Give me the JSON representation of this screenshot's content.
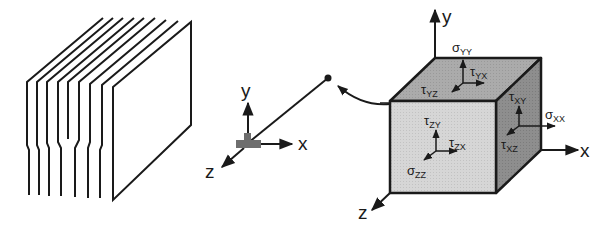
{
  "diagram": {
    "colors": {
      "stroke": "#1a1a1a",
      "background": "#ffffff",
      "cube_front": "#d4d4d4",
      "cube_top": "#a9a9a9",
      "cube_right": "#8c8c8c",
      "bracket": "#6e6e6e"
    },
    "left_panel": {
      "description": "stack of sheet layers",
      "layer_count": 9
    },
    "middle_axes": {
      "labels": {
        "y": "y",
        "x": "x",
        "z": "z"
      }
    },
    "cube_axes": {
      "labels": {
        "y": "y",
        "x": "x",
        "z": "z"
      }
    },
    "stress_labels": {
      "sigma_yy": {
        "symbol": "σ",
        "sub": "YY"
      },
      "tau_yx": {
        "symbol": "τ",
        "sub": "YX"
      },
      "tau_yz": {
        "symbol": "τ",
        "sub": "YZ"
      },
      "tau_xy": {
        "symbol": "τ",
        "sub": "XY"
      },
      "sigma_xx": {
        "symbol": "σ",
        "sub": "XX"
      },
      "tau_xz": {
        "symbol": "τ",
        "sub": "XZ"
      },
      "tau_zy": {
        "symbol": "τ",
        "sub": "ZY"
      },
      "tau_zx": {
        "symbol": "τ",
        "sub": "ZX"
      },
      "sigma_zz": {
        "symbol": "σ",
        "sub": "ZZ"
      }
    }
  }
}
